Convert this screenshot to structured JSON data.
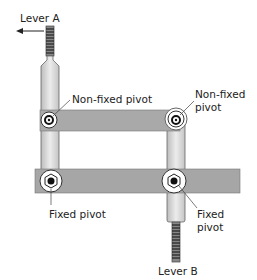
{
  "diagram": {
    "labels": {
      "lever_a": "Lever A",
      "lever_b": "Lever B",
      "nonfixed_left": "Non-fixed pivot",
      "nonfixed_right_line1": "Non-fixed",
      "nonfixed_right_line2": "pivot",
      "fixed_left": "Fixed pivot",
      "fixed_right_line1": "Fixed",
      "fixed_right_line2": "pivot"
    },
    "colors": {
      "bar": "#a8a8a8",
      "rod": "#d6d6d6",
      "outline": "#555555",
      "text": "#222222"
    }
  }
}
